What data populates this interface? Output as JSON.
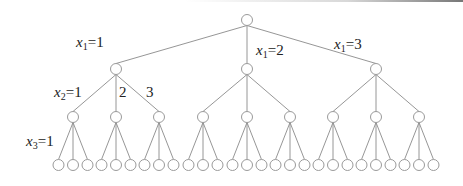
{
  "diagram": {
    "type": "tree",
    "colors": {
      "node_stroke": "#9a9a9a",
      "edge": "#8a8a8a",
      "text": "#222222"
    },
    "root": {
      "x": 247,
      "y": 20
    },
    "levels": [
      {
        "y": 69,
        "xs": [
          116,
          247,
          376
        ]
      },
      {
        "y": 117,
        "xs": [
          73,
          116,
          159,
          203,
          247,
          290,
          333,
          376,
          419
        ]
      },
      {
        "y": 165,
        "spacing": 14.5
      }
    ],
    "labels": [
      {
        "id": "x1-1",
        "var": "x",
        "sub": "1",
        "value": "=1",
        "x": 76,
        "y": 34
      },
      {
        "id": "x1-2",
        "var": "x",
        "sub": "1",
        "value": "=2",
        "x": 256,
        "y": 42
      },
      {
        "id": "x1-3",
        "var": "x",
        "sub": "1",
        "value": "=3",
        "x": 334,
        "y": 36
      },
      {
        "id": "x2-1",
        "var": "x",
        "sub": "2",
        "value": "=1",
        "x": 54,
        "y": 84
      },
      {
        "id": "x2-2",
        "var": "",
        "sub": "",
        "value": "2",
        "x": 119,
        "y": 84
      },
      {
        "id": "x2-3",
        "var": "",
        "sub": "",
        "value": "3",
        "x": 146,
        "y": 84
      },
      {
        "id": "x3-1",
        "var": "x",
        "sub": "3",
        "value": "=1",
        "x": 26,
        "y": 133
      }
    ]
  }
}
